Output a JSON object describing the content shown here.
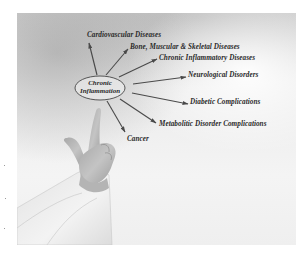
{
  "diagram": {
    "center": {
      "line1": "Chronic",
      "line2": "Inflammation"
    },
    "branches": [
      {
        "label": "Cardiovascular Diseases"
      },
      {
        "label": "Bone, Muscular & Skeletal Diseases"
      },
      {
        "label": "Chronic Inflammatory Diseases"
      },
      {
        "label": "Neurological Disorders"
      },
      {
        "label": "Diabetic Complications"
      },
      {
        "label": "Metabolitic Disorder Complications"
      },
      {
        "label": "Cancer"
      }
    ]
  },
  "colors": {
    "text": "#2a2a2a",
    "arrows": "#4a4a4a",
    "background": "#ffffff",
    "photo_light": "#f4f4f4",
    "photo_dark": "#bdbdbd"
  },
  "photo": {
    "subject": "hand pointing upward at diagram center, white coat sleeve"
  }
}
